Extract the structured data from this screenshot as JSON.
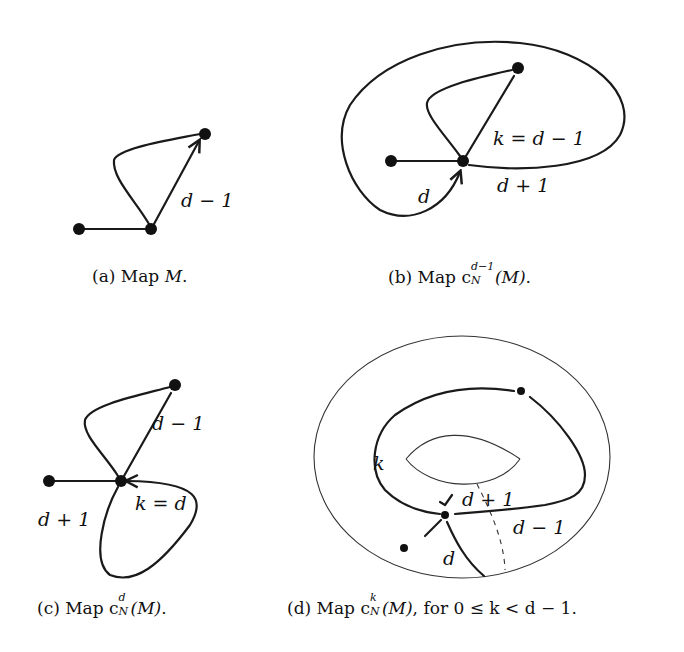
{
  "figure": {
    "panels": [
      {
        "id": "a",
        "caption_prefix": "(a) Map ",
        "caption_math": "M",
        "caption_suffix": ".",
        "edge_labels": [
          "d − 1"
        ]
      },
      {
        "id": "b",
        "caption_prefix": "(b) Map c",
        "caption_sup": "d−1",
        "caption_sub": "N",
        "caption_math": "(M)",
        "caption_suffix": ".",
        "edge_labels": [
          "k = d − 1",
          "d + 1",
          "d"
        ]
      },
      {
        "id": "c",
        "caption_prefix": "(c) Map c",
        "caption_sup": "d",
        "caption_sub": "N",
        "caption_math": "(M)",
        "caption_suffix": ".",
        "edge_labels": [
          "d − 1",
          "k = d",
          "d + 1"
        ]
      },
      {
        "id": "d",
        "caption_prefix": "(d) Map c",
        "caption_sup": "k",
        "caption_sub": "N",
        "caption_math": "(M)",
        "caption_suffix": ", for 0 ≤ k < d − 1.",
        "edge_labels": [
          "k",
          "d + 1",
          "d − 1",
          "d"
        ]
      }
    ]
  }
}
